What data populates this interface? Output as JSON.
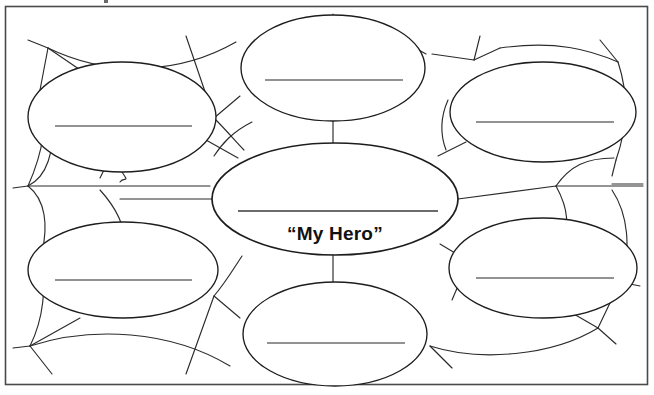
{
  "page": {
    "background_color": "#ffffff",
    "ink_color": "#1d1d1d",
    "rule_color": "#6e6e6e",
    "frame_color": "#4a4a4a"
  },
  "center_bubble": {
    "name": "center-topic-bubble",
    "label": "“My Hero”",
    "write_line": "",
    "cx": 335,
    "cy": 199,
    "rx": 123,
    "ry": 56
  },
  "branch_bubbles": [
    {
      "id": "top-center",
      "position": "top-center",
      "label": "",
      "cx": 333,
      "cy": 68,
      "rx": 92,
      "ry": 53
    },
    {
      "id": "top-left",
      "position": "top-left",
      "label": "",
      "cx": 122,
      "cy": 117,
      "rx": 94,
      "ry": 55
    },
    {
      "id": "top-right",
      "position": "top-right",
      "label": "",
      "cx": 543,
      "cy": 112,
      "rx": 93,
      "ry": 50
    },
    {
      "id": "bottom-left",
      "position": "bottom-left",
      "label": "",
      "cx": 123,
      "cy": 270,
      "rx": 95,
      "ry": 48
    },
    {
      "id": "bottom-right",
      "position": "bottom-right",
      "label": "",
      "cx": 543,
      "cy": 268,
      "rx": 94,
      "ry": 50
    },
    {
      "id": "bottom-center",
      "position": "bottom-center",
      "label": "",
      "cx": 335,
      "cy": 334,
      "rx": 92,
      "ry": 52
    }
  ],
  "frame": {
    "name": "worksheet-border",
    "x": 5,
    "y": 6,
    "width": 643,
    "height": 379
  },
  "legend": {
    "instruction": ""
  }
}
